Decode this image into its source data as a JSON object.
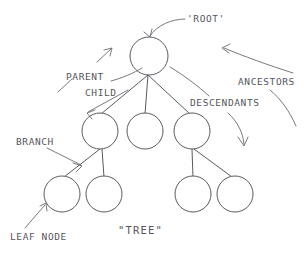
{
  "diagram": {
    "caption": "\"TREE\"",
    "title_label": "'ROOT'",
    "colors": {
      "background": "#ffffff",
      "stroke": "#5a5a62",
      "leader": "#6a6a72",
      "text": "#55555d"
    },
    "labels": {
      "root": "'ROOT'",
      "parent": "PARENT",
      "child": "CHILD",
      "ancestors": "ANCESTORS",
      "descendants": "DESCENDANTS",
      "branch": "BRANCH",
      "leaf_node": "LEAF NODE",
      "tree": "\"TREE\""
    },
    "nodes": [
      {
        "id": "root",
        "level": 0,
        "cx": 149,
        "cy": 56,
        "r": 19
      },
      {
        "id": "mid-1",
        "level": 1,
        "cx": 100,
        "cy": 131,
        "r": 18
      },
      {
        "id": "mid-2",
        "level": 1,
        "cx": 145,
        "cy": 131,
        "r": 18
      },
      {
        "id": "mid-3",
        "level": 1,
        "cx": 192,
        "cy": 131,
        "r": 18
      },
      {
        "id": "leaf-1",
        "level": 2,
        "cx": 62,
        "cy": 194,
        "r": 18
      },
      {
        "id": "leaf-2",
        "level": 2,
        "cx": 104,
        "cy": 194,
        "r": 18
      },
      {
        "id": "leaf-3",
        "level": 2,
        "cx": 193,
        "cy": 194,
        "r": 18
      },
      {
        "id": "leaf-4",
        "level": 2,
        "cx": 235,
        "cy": 194,
        "r": 18
      }
    ],
    "edges": [
      {
        "from": "root",
        "to": "mid-1"
      },
      {
        "from": "root",
        "to": "mid-2"
      },
      {
        "from": "root",
        "to": "mid-3"
      },
      {
        "from": "mid-1",
        "to": "leaf-1"
      },
      {
        "from": "mid-1",
        "to": "leaf-2"
      },
      {
        "from": "mid-3",
        "to": "leaf-3"
      },
      {
        "from": "mid-3",
        "to": "leaf-4"
      }
    ],
    "annotations": [
      {
        "id": "root",
        "text": "'ROOT'",
        "x": 187,
        "y": 22,
        "points_to": "root"
      },
      {
        "id": "parent",
        "text": "PARENT",
        "x": 66,
        "y": 78,
        "points_to": "root"
      },
      {
        "id": "child",
        "text": "CHILD",
        "x": 84,
        "y": 94,
        "points_to": "mid-1"
      },
      {
        "id": "ancestors",
        "text": "ANCESTORS",
        "x": 238,
        "y": 83,
        "points_to": "root"
      },
      {
        "id": "descendants",
        "text": "DESCENDANTS",
        "x": 190,
        "y": 104,
        "points_to": "leaf-4"
      },
      {
        "id": "branch",
        "text": "BRANCH",
        "x": 16,
        "y": 142,
        "points_to": "edge-mid1-leaf1"
      },
      {
        "id": "leaf-node",
        "text": "LEAF NODE",
        "x": 10,
        "y": 238,
        "points_to": "leaf-1"
      }
    ]
  }
}
